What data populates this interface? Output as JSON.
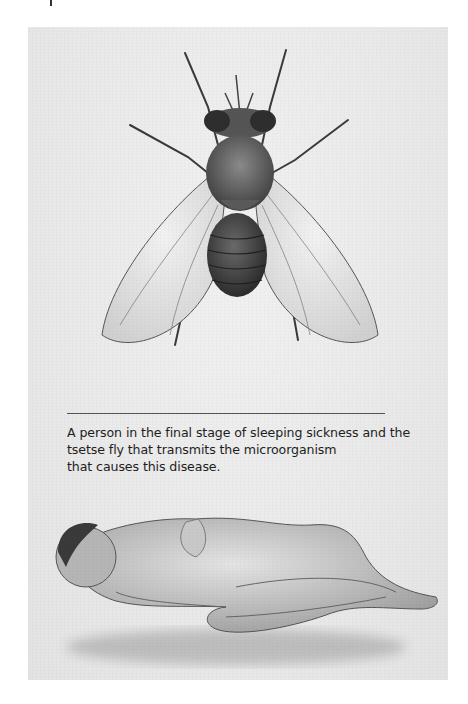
{
  "page": {
    "background": "#ffffff",
    "panel_background": "#e9e9e9"
  },
  "illustrations": {
    "fly": {
      "subject": "tsetse fly",
      "style": "pencil drawing, top view"
    },
    "person": {
      "subject": "person in the final stage of sleeping sickness",
      "style": "pencil drawing, lying curled on side"
    }
  },
  "caption": {
    "lines": [
      "A person in the final stage of sleeping sickness and the",
      "tsetse fly that transmits the microorganism",
      "that causes this disease."
    ]
  }
}
